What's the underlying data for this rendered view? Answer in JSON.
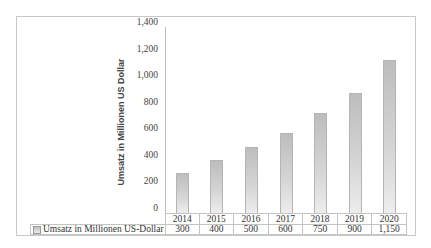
{
  "chart_data": {
    "type": "bar",
    "title": "",
    "xlabel": "",
    "ylabel": "Umsatz in Millionen US Dollar",
    "categories": [
      "2014",
      "2015",
      "2016",
      "2017",
      "2018",
      "2019",
      "2020"
    ],
    "series": [
      {
        "name": "Umsatz in Millionen US-Dollar",
        "values": [
          300,
          400,
          500,
          600,
          750,
          900,
          1150
        ],
        "value_labels": [
          "300",
          "400",
          "500",
          "600",
          "750",
          "900",
          "1,150"
        ],
        "color": "#d0d0d0"
      }
    ],
    "ylim": [
      0,
      1400
    ],
    "yticks": [
      0,
      200,
      400,
      600,
      800,
      1000,
      1200,
      1400
    ],
    "ytick_labels": [
      "0",
      "200",
      "400",
      "600",
      "800",
      "1,000",
      "1,200",
      "1,400"
    ],
    "grid": false,
    "legend_position": "data-table",
    "data_table": true
  }
}
